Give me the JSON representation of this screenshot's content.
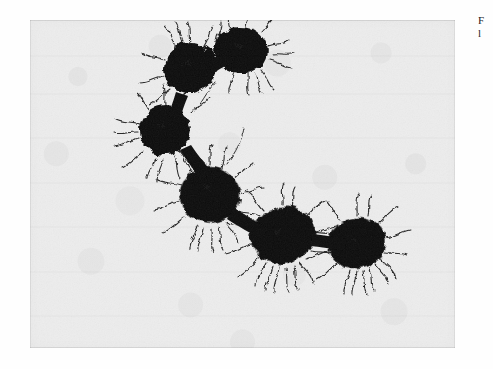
{
  "document": {
    "kind": "scanned-page-figure",
    "page_background": "#fefefe"
  },
  "figure": {
    "name": "electron-micrograph-plate",
    "modality": "transmission electron micrograph",
    "plate": {
      "x": 30,
      "y": 20,
      "width": 425,
      "height": 328,
      "background_color": "#ededed",
      "cell_color": "#0d0d0d",
      "fimbriae_color": "#161616"
    },
    "cells": [
      {
        "id": "cell-1",
        "label": "top-left cell",
        "cx": 160,
        "cy": 48,
        "rx": 26,
        "ry": 25,
        "rotate": -12
      },
      {
        "id": "cell-2",
        "label": "top-right cell",
        "cx": 211,
        "cy": 30,
        "rx": 27,
        "ry": 23,
        "rotate": 8
      },
      {
        "id": "cell-3",
        "label": "upper-middle cell",
        "cx": 135,
        "cy": 110,
        "rx": 26,
        "ry": 25,
        "rotate": -6
      },
      {
        "id": "cell-4",
        "label": "middle cell",
        "cx": 180,
        "cy": 175,
        "rx": 30,
        "ry": 28,
        "rotate": 10
      },
      {
        "id": "cell-5",
        "label": "lower-right cell",
        "cx": 253,
        "cy": 215,
        "rx": 33,
        "ry": 28,
        "rotate": -18
      },
      {
        "id": "cell-6",
        "label": "terminal cell",
        "cx": 327,
        "cy": 223,
        "rx": 29,
        "ry": 25,
        "rotate": -12
      }
    ],
    "arrangement": "C-shaped arc chain of six cells, diplococcal pairs, densely fimbriated"
  },
  "margin_caption": {
    "truncated": true,
    "lines": [
      "F",
      "l"
    ]
  }
}
